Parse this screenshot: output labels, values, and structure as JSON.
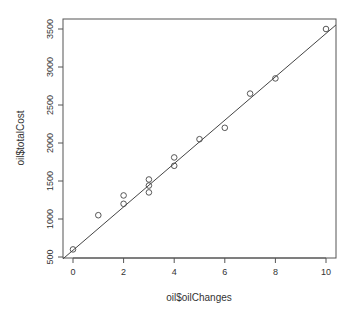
{
  "chart_data": {
    "type": "scatter",
    "title": "",
    "xlabel": "oil$oilChanges",
    "ylabel": "oil$totalCost",
    "xlim": [
      -0.4,
      10.4
    ],
    "ylim": [
      490,
      3580
    ],
    "xticks": [
      0,
      2,
      4,
      6,
      8,
      10
    ],
    "yticks": [
      500,
      1000,
      1500,
      2000,
      2500,
      3000,
      3500
    ],
    "grid": false,
    "legend": null,
    "points": [
      {
        "x": 0,
        "y": 600
      },
      {
        "x": 1,
        "y": 1050
      },
      {
        "x": 2,
        "y": 1200
      },
      {
        "x": 2,
        "y": 1310
      },
      {
        "x": 3,
        "y": 1350
      },
      {
        "x": 3,
        "y": 1440
      },
      {
        "x": 3,
        "y": 1520
      },
      {
        "x": 4,
        "y": 1700
      },
      {
        "x": 4,
        "y": 1810
      },
      {
        "x": 5,
        "y": 2050
      },
      {
        "x": 6,
        "y": 2200
      },
      {
        "x": 7,
        "y": 2650
      },
      {
        "x": 8,
        "y": 2850
      },
      {
        "x": 10,
        "y": 3500
      }
    ],
    "fit_line": {
      "intercept": 590,
      "slope": 285
    }
  },
  "labels": {
    "xlabel": "oil$oilChanges",
    "ylabel": "oil$totalCost"
  }
}
